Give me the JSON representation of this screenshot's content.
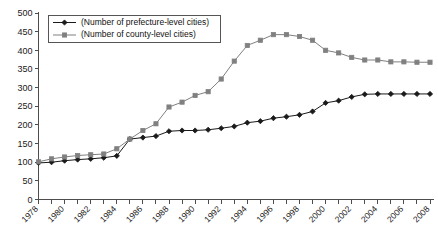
{
  "chart_data": {
    "type": "line",
    "title": "",
    "subtitle": "",
    "xlabel": "",
    "ylabel": "",
    "xlim": [
      1978,
      2008
    ],
    "ylim": [
      0,
      500
    ],
    "ytick_step": 50,
    "yticks": [
      0,
      50,
      100,
      150,
      200,
      250,
      300,
      350,
      400,
      450,
      500
    ],
    "ytick_labels": [
      "0",
      "50",
      "100",
      "150",
      "200",
      "250",
      "300",
      "350",
      "400",
      "450",
      "500"
    ],
    "x": [
      1978,
      1979,
      1980,
      1981,
      1982,
      1983,
      1984,
      1985,
      1986,
      1987,
      1988,
      1989,
      1990,
      1991,
      1992,
      1993,
      1994,
      1995,
      1996,
      1997,
      1998,
      1999,
      2000,
      2001,
      2002,
      2003,
      2004,
      2005,
      2006,
      2007,
      2008
    ],
    "xtick_labels": [
      "1978",
      "1980",
      "1982",
      "1984",
      "1986",
      "1988",
      "1990",
      "1992",
      "1994",
      "1996",
      "1998",
      "2000",
      "2002",
      "2004",
      "2006",
      "2008"
    ],
    "xtick_label_years": [
      1978,
      1980,
      1982,
      1984,
      1986,
      1988,
      1990,
      1992,
      1994,
      1996,
      1998,
      2000,
      2002,
      2004,
      2006,
      2008
    ],
    "xtick_every_year": true,
    "xtick_label_rotation": -45,
    "grid": false,
    "legend_position": "top-left",
    "series": [
      {
        "name": "(Number of prefecture-level cities)",
        "color": "#1a1a1a",
        "marker": "diamond",
        "values": [
          98,
          100,
          104,
          107,
          109,
          112,
          117,
          162,
          166,
          170,
          183,
          185,
          185,
          187,
          191,
          196,
          206,
          210,
          218,
          222,
          227,
          236,
          259,
          265,
          275,
          282,
          283,
          283,
          283,
          283,
          283
        ]
      },
      {
        "name": "(Number of county-level cities)",
        "color": "#808080",
        "marker": "square",
        "values": [
          101,
          109,
          114,
          118,
          120,
          122,
          136,
          162,
          185,
          203,
          248,
          261,
          279,
          289,
          323,
          371,
          413,
          427,
          442,
          442,
          437,
          427,
          400,
          393,
          381,
          374,
          374,
          369,
          369,
          368,
          368
        ]
      }
    ]
  }
}
